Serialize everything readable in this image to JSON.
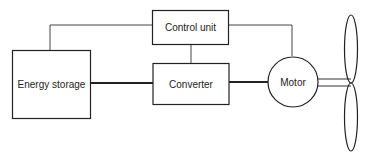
{
  "diagram": {
    "blocks": {
      "energy_storage": {
        "label": "Energy storage"
      },
      "control_unit": {
        "label": "Control unit"
      },
      "converter": {
        "label": "Converter"
      },
      "motor": {
        "label": "Motor"
      }
    },
    "connections": [
      {
        "from": "energy_storage",
        "to": "converter",
        "type": "power"
      },
      {
        "from": "converter",
        "to": "motor",
        "type": "power"
      },
      {
        "from": "control_unit",
        "to": "energy_storage",
        "type": "control"
      },
      {
        "from": "control_unit",
        "to": "converter",
        "type": "control"
      },
      {
        "from": "control_unit",
        "to": "motor",
        "type": "control"
      },
      {
        "from": "motor",
        "to": "propeller",
        "type": "shaft"
      }
    ],
    "colors": {
      "line": "#333333",
      "background": "#ffffff"
    }
  }
}
